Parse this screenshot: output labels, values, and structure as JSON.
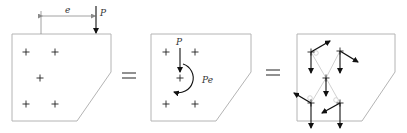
{
  "diagram": {
    "panels": [
      {
        "id": "eccentric-load",
        "labels": {
          "dimension": "e",
          "force": "P"
        },
        "bolts": 5
      },
      {
        "id": "direct-load-plus-moment",
        "labels": {
          "force": "P",
          "moment": "Pe"
        },
        "bolts": 5,
        "moment_direction": "clockwise"
      },
      {
        "id": "bolt-force-components",
        "bolts": 5,
        "components": [
          "direct-shear (downward)",
          "moment-induced (tangential, clockwise)"
        ]
      }
    ],
    "operators": [
      "=",
      "="
    ],
    "colors": {
      "plate_outline": "#b4b4b4",
      "force_arrow": "#111111",
      "bolt_mark": "#222222",
      "radial_line": "#c4c4c4"
    }
  }
}
